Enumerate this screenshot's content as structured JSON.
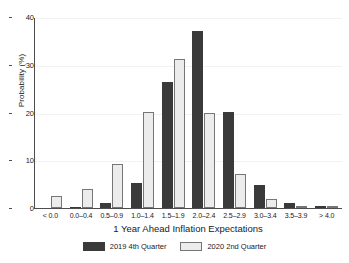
{
  "chart_data": {
    "type": "bar",
    "title": "",
    "xlabel": "1 Year Ahead Inflation Expectations",
    "ylabel": "Probability (%)",
    "categories": [
      "< 0.0",
      "0.0–0.4",
      "0.5–0.9",
      "1.0–1.4",
      "1.5–1.9",
      "2.0–2.4",
      "2.5–2.9",
      "3.0–3.4",
      "3.5–3.9",
      "> 4.0"
    ],
    "series": [
      {
        "name": "2019 4th Quarter",
        "color": "#3a3a3a",
        "values": [
          0.0,
          0.2,
          1.1,
          5.3,
          26.6,
          37.2,
          20.2,
          4.9,
          1.0,
          0.4
        ]
      },
      {
        "name": "2020 2nd Quarter",
        "color": "#ececec",
        "values": [
          2.6,
          4.1,
          9.2,
          20.3,
          31.4,
          20.1,
          7.2,
          1.8,
          0.1,
          0.3
        ]
      }
    ],
    "ylim": [
      0,
      40
    ],
    "yticks": [
      0,
      10,
      20,
      30,
      40
    ],
    "ytick_labels": [
      "0",
      "10",
      "20",
      "30",
      "40"
    ],
    "grid": true,
    "legend_position": "bottom-center"
  }
}
